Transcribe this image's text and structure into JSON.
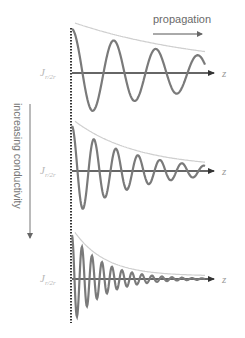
{
  "diagram": {
    "propagation_label": "propagation",
    "conductivity_label": "increasing conductivity",
    "axis_label": "z",
    "current_label_main": "J",
    "current_label_sub": "r/2r",
    "panels": [
      {
        "name": "low-conductivity",
        "axis_y": 73,
        "start_y": 29,
        "wavelength": 42,
        "decay": 0.0072
      },
      {
        "name": "medium-conductivity",
        "axis_y": 171,
        "start_y": 126,
        "wavelength": 22,
        "decay": 0.016
      },
      {
        "name": "high-conductivity",
        "axis_y": 279,
        "start_y": 235,
        "wavelength": 10,
        "decay": 0.032
      }
    ],
    "colors": {
      "wave": "#7a7a7a",
      "envelope": "#cfcfcf",
      "axis": "#333333",
      "dotted": "#333333",
      "label": "#b8b8b8"
    }
  }
}
